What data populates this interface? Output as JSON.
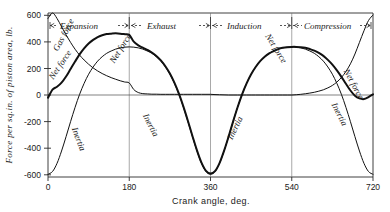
{
  "figure": {
    "title_visible": false,
    "background": "#ffffff",
    "ink_color": "#111111"
  },
  "axes": {
    "x_title": "Crank angle, deg.",
    "y_title": "Force per sq.in. of piston area, lb.",
    "x_ticks": [
      "0",
      "180",
      "360",
      "540",
      "720"
    ],
    "x_tick_values": [
      0,
      180,
      360,
      540,
      720
    ],
    "y_ticks": [
      "600",
      "400",
      "200",
      "0",
      "-200",
      "-400",
      "-600"
    ],
    "y_tick_values": [
      600,
      400,
      200,
      0,
      -200,
      -400,
      -600
    ],
    "xlim": [
      0,
      720
    ],
    "ylim": [
      -600,
      600
    ],
    "grid": "vertical gridlines at 180, 360, 540 plus horizontal zero line"
  },
  "phases": [
    {
      "label": "Expansion",
      "start": 0,
      "end": 180
    },
    {
      "label": "Exhaust",
      "start": 180,
      "end": 360
    },
    {
      "label": "Induction",
      "start": 360,
      "end": 540
    },
    {
      "label": "Compression",
      "start": 540,
      "end": 720
    }
  ],
  "curve_labels": [
    {
      "name": "Gas force",
      "text": "Gas force",
      "x": 40,
      "y": 430,
      "rotate": 62
    },
    {
      "name": "Net force",
      "text": "Net force",
      "x": 32,
      "y": 210,
      "rotate": 56
    },
    {
      "name": "Inertia",
      "text": "Inertia",
      "x": 62,
      "y": -330,
      "rotate": -70
    },
    {
      "name": "Net force",
      "text": "Net force",
      "x": 166,
      "y": 330,
      "rotate": 58
    },
    {
      "name": "Inertia",
      "text": "Inertia",
      "x": 222,
      "y": -230,
      "rotate": -63
    },
    {
      "name": "Inertia",
      "text": "Inertia",
      "x": 420,
      "y": -250,
      "rotate": 64
    },
    {
      "name": "Net force",
      "text": "Net force",
      "x": 500,
      "y": 330,
      "rotate": -58
    },
    {
      "name": "Inertia",
      "text": "Inertia",
      "x": 640,
      "y": -150,
      "rotate": -63
    },
    {
      "name": "Net force",
      "text": "Net force",
      "x": 672,
      "y": 70,
      "rotate": -62
    }
  ],
  "chart_data": {
    "type": "line",
    "title": "",
    "xlabel": "Crank angle, deg.",
    "ylabel": "Force per sq.in. of piston area, lb.",
    "xlim": [
      0,
      720
    ],
    "ylim": [
      -600,
      600
    ],
    "grid": true,
    "legend": "inline curve labels",
    "x": [
      0,
      10,
      20,
      30,
      40,
      50,
      60,
      70,
      80,
      90,
      100,
      110,
      120,
      130,
      140,
      150,
      160,
      170,
      180,
      190,
      200,
      210,
      220,
      230,
      240,
      250,
      260,
      270,
      280,
      290,
      300,
      310,
      320,
      330,
      340,
      350,
      360,
      370,
      380,
      390,
      400,
      410,
      420,
      430,
      440,
      450,
      460,
      470,
      480,
      490,
      500,
      510,
      520,
      530,
      540,
      550,
      560,
      570,
      580,
      590,
      600,
      610,
      620,
      630,
      640,
      650,
      660,
      670,
      680,
      690,
      700,
      710,
      720
    ],
    "series": [
      {
        "name": "Gas force",
        "note": "cylinder gas pressure force; peak ~600 just after TDC on expansion, decays to near zero during exhaust and induction, rises again at end of compression",
        "values": [
          560,
          600,
          560,
          500,
          440,
          385,
          335,
          292,
          256,
          225,
          198,
          176,
          157,
          141,
          127,
          115,
          104,
          95,
          88,
          40,
          18,
          10,
          8,
          6,
          6,
          5,
          5,
          5,
          5,
          5,
          5,
          5,
          5,
          5,
          5,
          5,
          5,
          3,
          2,
          1,
          0,
          0,
          0,
          0,
          0,
          0,
          0,
          0,
          0,
          0,
          0,
          0,
          0,
          0,
          0,
          2,
          5,
          9,
          14,
          20,
          28,
          38,
          52,
          70,
          95,
          128,
          172,
          228,
          300,
          385,
          470,
          545,
          585
        ]
      },
      {
        "name": "Inertia",
        "note": "reciprocating inertia force; minimum near -580 at dead centres (0, 360, 720), maximum near +350 at mid-stroke (180, 540)",
        "values": [
          -580,
          -560,
          -500,
          -410,
          -305,
          -195,
          -90,
          5,
          85,
          152,
          205,
          248,
          280,
          305,
          322,
          336,
          345,
          350,
          352,
          350,
          345,
          336,
          322,
          305,
          280,
          248,
          205,
          152,
          85,
          5,
          -90,
          -195,
          -305,
          -410,
          -500,
          -560,
          -580,
          -560,
          -500,
          -410,
          -305,
          -195,
          -90,
          5,
          85,
          152,
          205,
          248,
          280,
          305,
          322,
          336,
          345,
          350,
          352,
          350,
          345,
          336,
          322,
          305,
          280,
          248,
          205,
          152,
          85,
          5,
          -90,
          -195,
          -305,
          -410,
          -500,
          -560,
          -580
        ]
      },
      {
        "name": "Net force",
        "note": "sum of gas force and inertia force; heavy line",
        "values": [
          -20,
          40,
          60,
          90,
          135,
          190,
          245,
          297,
          341,
          377,
          403,
          424,
          437,
          446,
          449,
          451,
          449,
          445,
          440,
          390,
          363,
          346,
          330,
          311,
          286,
          253,
          210,
          157,
          90,
          10,
          -85,
          -190,
          -300,
          -405,
          -495,
          -555,
          -575,
          -557,
          -498,
          -409,
          -305,
          -195,
          -90,
          5,
          85,
          152,
          205,
          248,
          280,
          305,
          322,
          336,
          345,
          350,
          352,
          352,
          350,
          345,
          336,
          325,
          308,
          286,
          257,
          222,
          180,
          133,
          82,
          33,
          -5,
          -25,
          -30,
          -15,
          5
        ]
      }
    ]
  }
}
